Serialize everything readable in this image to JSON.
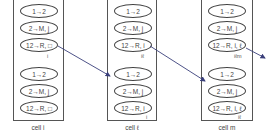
{
  "cells": [
    {
      "label": "cell i",
      "groups": [
        {
          "items": [
            "1→2",
            "2→M, j",
            "12→R, □"
          ],
          "tag": "i"
        },
        {
          "items": [
            "1→2",
            "2→M, j",
            "12→R, □"
          ],
          "tag": ""
        }
      ]
    },
    {
      "label": "cell ℓ",
      "groups": [
        {
          "items": [
            "1→2",
            "2→M, j",
            "12→R, i"
          ],
          "tag": "iℓ"
        },
        {
          "items": [
            "1→2",
            "2→M, j",
            "12→R, i"
          ],
          "tag": "i"
        }
      ]
    },
    {
      "label": "cell m",
      "groups": [
        {
          "items": [
            "1→2",
            "2→M, j",
            "12→R, i, ℓ"
          ],
          "tag": "iℓm"
        },
        {
          "items": [
            "1→2",
            "2→M, j",
            "12→R, i, ℓ"
          ],
          "tag": "iℓ"
        }
      ]
    }
  ],
  "colors": {
    "arrow": "#3a3f7a",
    "line": "#555555"
  }
}
